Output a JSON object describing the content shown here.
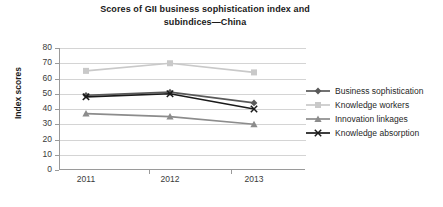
{
  "chart_data": {
    "type": "line",
    "title": "Scores of GII business sophistication index and subindices—China",
    "title_line1": "Scores of GII business sophistication index and",
    "title_line2": "subindices—China",
    "xlabel": "",
    "ylabel": "Index scores",
    "categories": [
      "2011",
      "2012",
      "2013"
    ],
    "ylim": [
      0,
      80
    ],
    "yticks": [
      0,
      10,
      20,
      30,
      40,
      50,
      60,
      70,
      80
    ],
    "ytick_labels": [
      "0",
      "10",
      "20",
      "30",
      "40",
      "50",
      "60",
      "70",
      "80"
    ],
    "grid": true,
    "legend_position": "right",
    "series": [
      {
        "name": "Business sophistication",
        "marker": "diamond",
        "color": "#595959",
        "values": [
          49,
          51,
          44
        ]
      },
      {
        "name": "Knowledge workers",
        "marker": "square",
        "color": "#c9c9c9",
        "values": [
          65,
          70,
          64
        ]
      },
      {
        "name": "Innovation linkages",
        "marker": "triangle",
        "color": "#8c8c8c",
        "values": [
          37,
          35,
          30
        ]
      },
      {
        "name": "Knowledge absorption",
        "marker": "x",
        "color": "#1a1a1a",
        "values": [
          48,
          50,
          40
        ]
      }
    ]
  },
  "legend": {
    "items": [
      {
        "label": "Business sophistication"
      },
      {
        "label": "Knowledge workers"
      },
      {
        "label": "Innovation linkages"
      },
      {
        "label": "Knowledge absorption"
      }
    ]
  }
}
